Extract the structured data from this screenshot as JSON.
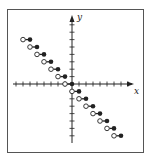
{
  "chart_data": {
    "type": "scatter",
    "xlabel": "x",
    "ylabel": "y",
    "xlim": [
      -8,
      9
    ],
    "ylim": [
      -8,
      9
    ],
    "grid": false,
    "segments": [
      {
        "x_open": -7,
        "x_closed": -6,
        "y": 6
      },
      {
        "x_open": -6,
        "x_closed": -5,
        "y": 5
      },
      {
        "x_open": -5,
        "x_closed": -4,
        "y": 4
      },
      {
        "x_open": -4,
        "x_closed": -3,
        "y": 3
      },
      {
        "x_open": -3,
        "x_closed": -2,
        "y": 2
      },
      {
        "x_open": -2,
        "x_closed": -1,
        "y": 1
      },
      {
        "x_open": -1,
        "x_closed": 0,
        "y": 0
      },
      {
        "x_open": 0,
        "x_closed": 1,
        "y": -1
      },
      {
        "x_open": 1,
        "x_closed": 2,
        "y": -2
      },
      {
        "x_open": 2,
        "x_closed": 3,
        "y": -3
      },
      {
        "x_open": 3,
        "x_closed": 4,
        "y": -4
      },
      {
        "x_open": 4,
        "x_closed": 5,
        "y": -5
      },
      {
        "x_open": 5,
        "x_closed": 6,
        "y": -6
      },
      {
        "x_open": 6,
        "x_closed": 7,
        "y": -7
      }
    ]
  },
  "axes": {
    "x_label": "x",
    "y_label": "y",
    "color": "#222222"
  }
}
